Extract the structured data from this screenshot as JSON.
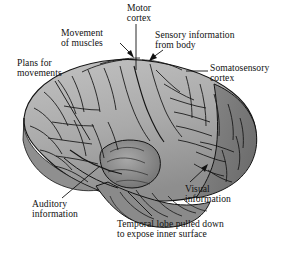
{
  "figure": {
    "type": "anatomical-illustration",
    "background_color": "#ffffff",
    "line_color": "#111111",
    "fill_light": "#b7b7b7",
    "fill_mid": "#9d9d9d",
    "fill_dark": "#7e7e7e",
    "fill_darkest": "#5f5f5f"
  },
  "labels": {
    "motor_cortex": "Motor\ncortex",
    "movement_of_muscles": "Movement\nof muscles",
    "sensory_information_from_body": "Sensory information\nfrom body",
    "somatosensory_cortex": "Somatosensory\ncortex",
    "plans_for_movements": "Plans for\nmovements",
    "auditory_information": "Auditory\ninformation",
    "visual_information": "Visual\ninformation",
    "temporal_lobe": "Temporal lobe pulled down\nto expose inner surface"
  }
}
